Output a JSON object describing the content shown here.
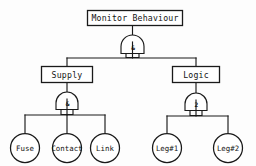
{
  "diagram": {
    "type": "fault-tree",
    "title_node": "Monitor Behaviour",
    "background": "#fdfdfd",
    "line_color": "#1a1a1a",
    "nodes": {
      "top_event": {
        "label": "Monitor Behaviour",
        "shape": "rectangle"
      },
      "intermediate": [
        {
          "label": "Supply",
          "shape": "rectangle"
        },
        {
          "label": "Logic",
          "shape": "rectangle"
        }
      ],
      "basic_events": [
        {
          "label": "Fuse",
          "shape": "circle"
        },
        {
          "label": "Contact",
          "shape": "circle"
        },
        {
          "label": "Link",
          "shape": "circle"
        },
        {
          "label": "Leg#1",
          "shape": "circle"
        },
        {
          "label": "Leg#2",
          "shape": "circle"
        }
      ]
    },
    "gates": [
      {
        "id": "gate-top",
        "symbol": "&",
        "kind": "and-gate",
        "parent": "Monitor Behaviour"
      },
      {
        "id": "gate-supply",
        "symbol": "&",
        "kind": "and-gate",
        "parent": "Supply"
      },
      {
        "id": "gate-logic",
        "symbol": "2",
        "kind": "voting-gate",
        "parent": "Logic"
      }
    ]
  }
}
